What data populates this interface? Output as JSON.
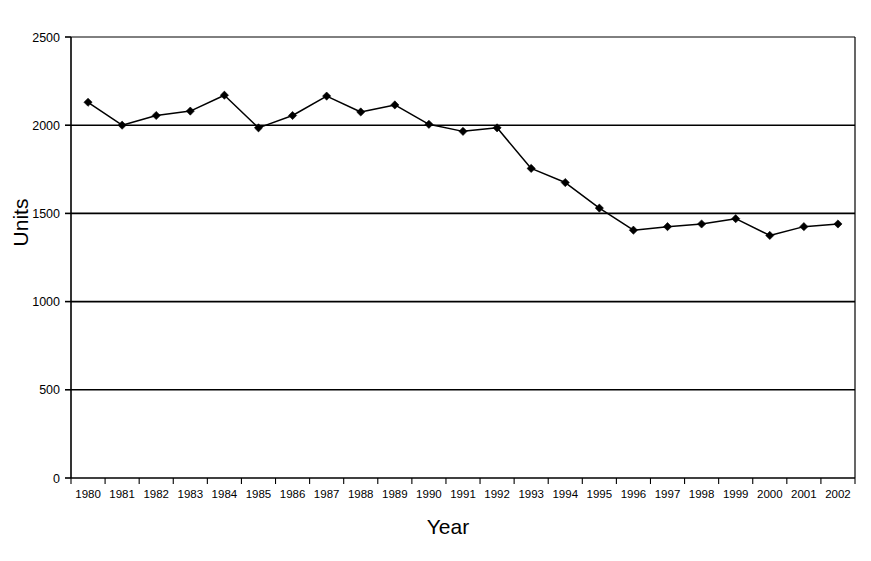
{
  "chart_data": {
    "type": "line",
    "title": "",
    "subtitle": "",
    "xlabel": "Year",
    "ylabel": "Units",
    "categories": [
      "1980",
      "1981",
      "1982",
      "1983",
      "1984",
      "1985",
      "1986",
      "1987",
      "1988",
      "1989",
      "1990",
      "1991",
      "1992",
      "1993",
      "1994",
      "1995",
      "1996",
      "1997",
      "1998",
      "1999",
      "2000",
      "2001",
      "2002"
    ],
    "series": [
      {
        "name": "Units",
        "values": [
          2130,
          2000,
          2055,
          2080,
          2170,
          1985,
          2055,
          2165,
          2075,
          2115,
          2005,
          1965,
          1985,
          1755,
          1675,
          1530,
          1405,
          1425,
          1440,
          1470,
          1375,
          1425,
          1440
        ],
        "color": "#000000",
        "marker": "diamond"
      }
    ],
    "ylim": [
      0,
      2500
    ],
    "yticks": [
      0,
      500,
      1000,
      1500,
      2000,
      2500
    ],
    "ytick_labels": [
      "0",
      "500",
      "1000",
      "1500",
      "2000",
      "2500"
    ],
    "grid": "horizontal",
    "grid_color": "#000000",
    "legend": "none",
    "legend_position": "none",
    "plot_border": true,
    "background": "#ffffff"
  },
  "axes": {
    "y_title": "Units",
    "x_title": "Year"
  }
}
